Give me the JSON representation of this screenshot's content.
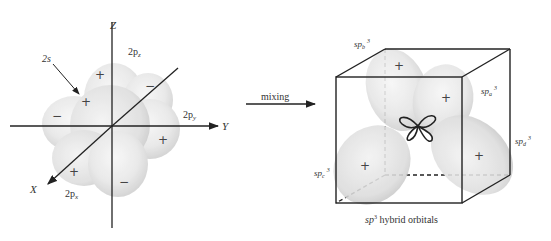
{
  "left_figure": {
    "title": "",
    "axes": {
      "z": "Z",
      "y": "Y",
      "x": "X"
    },
    "orbital_labels": {
      "s": "2s",
      "pz": "2p",
      "pz_sub": "z",
      "py": "2p",
      "py_sub": "y",
      "px": "2p",
      "px_sub": "x"
    },
    "signs": {
      "pz_top": "+",
      "pz_bottom": "−",
      "py_right": "+",
      "py_left": "−",
      "px_front": "+",
      "px_back": "−",
      "s": "+"
    }
  },
  "transition": {
    "label": "mixing"
  },
  "right_figure": {
    "caption_prefix": "sp",
    "caption_sup": "3",
    "caption_rest": " hybrid orbitals",
    "orbitals": [
      {
        "id": "a",
        "base": "sp",
        "sub": "a",
        "sup": "3",
        "sign": "+"
      },
      {
        "id": "b",
        "base": "sp",
        "sub": "b",
        "sup": "3",
        "sign": "+"
      },
      {
        "id": "c",
        "base": "sp",
        "sub": "c",
        "sup": "3",
        "sign": "+"
      },
      {
        "id": "d",
        "base": "sp",
        "sub": "d",
        "sup": "3",
        "sign": "+"
      }
    ]
  },
  "colors": {
    "lobe_fill": "#d9d9d9",
    "line": "#222222",
    "background": "#ffffff"
  }
}
